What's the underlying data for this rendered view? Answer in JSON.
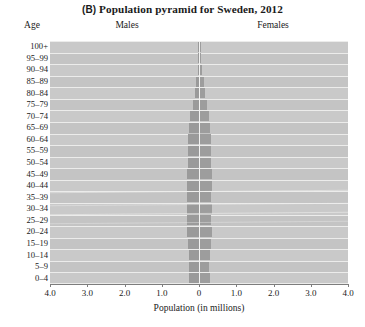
{
  "figure": {
    "panel_tag": "(B)",
    "title": "Population pyramid for Sweden, 2012",
    "age_header": "Age",
    "males_header": "Males",
    "females_header": "Females"
  },
  "chart_data": {
    "type": "bar",
    "orientation": "population-pyramid",
    "title": "(B) Population pyramid for Sweden, 2012",
    "xlabel": "Population (in millions)",
    "ylabel": "Age",
    "grid": true,
    "legend_position": "top-inline",
    "xlim": [
      -4.0,
      4.0
    ],
    "xtick_labels": [
      "4.0",
      "3.0",
      "2.0",
      "1.0",
      "0",
      "1.0",
      "2.0",
      "3.0",
      "4.0"
    ],
    "xtick_values": [
      -4.0,
      -3.0,
      -2.0,
      -1.0,
      0.0,
      1.0,
      2.0,
      3.0,
      4.0
    ],
    "categories": [
      "100+",
      "95–99",
      "90–94",
      "85–89",
      "80–84",
      "75–79",
      "70–74",
      "65–69",
      "60–64",
      "55–59",
      "50–54",
      "45–49",
      "40–44",
      "35–39",
      "30–34",
      "25–29",
      "20–24",
      "15–19",
      "10–14",
      "5–9",
      "0–4"
    ],
    "series": [
      {
        "name": "Males",
        "side": "left",
        "color": "#9a9a9a",
        "values": [
          0.001,
          0.008,
          0.03,
          0.077,
          0.114,
          0.157,
          0.232,
          0.256,
          0.29,
          0.287,
          0.288,
          0.326,
          0.319,
          0.31,
          0.32,
          0.317,
          0.334,
          0.3,
          0.27,
          0.262,
          0.278
        ]
      },
      {
        "name": "Females",
        "side": "right",
        "color": "#9d9d9d",
        "values": [
          0.004,
          0.022,
          0.06,
          0.114,
          0.146,
          0.177,
          0.248,
          0.266,
          0.295,
          0.286,
          0.283,
          0.319,
          0.31,
          0.301,
          0.31,
          0.301,
          0.317,
          0.285,
          0.256,
          0.248,
          0.263
        ]
      }
    ]
  },
  "colors": {
    "plot_background": "#c9c9c9",
    "gridline": "#ecece b",
    "bar_male": "#9a9a9a",
    "bar_female": "#9d9d9d",
    "axis": "#7d7d7d",
    "text": "#1a1a1a"
  }
}
